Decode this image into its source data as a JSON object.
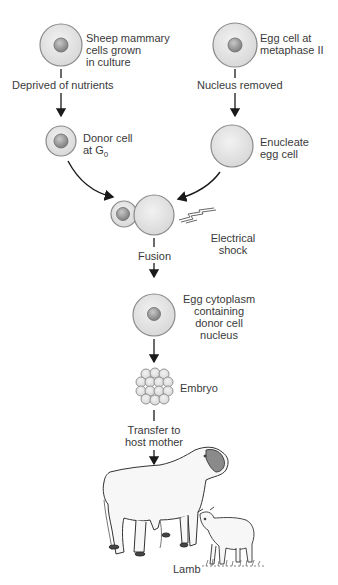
{
  "diagram": {
    "colors": {
      "cell_fill": "#e4e4e4",
      "cell_stroke": "#8a8a8a",
      "nucleus_fill": "#9a9a9a",
      "arrow": "#1a1a1a",
      "text": "#3a3a3a"
    },
    "nodes": {
      "mammary_cells": {
        "label": "Sheep mammary\ncells grown\nin culture"
      },
      "egg_cell": {
        "label": "Egg cell at\nmetaphase II"
      },
      "donor_cell": {
        "label_main": "Donor cell\nat G",
        "label_sub": "0"
      },
      "enucleate_egg": {
        "label": "Enucleate\negg cell"
      },
      "electrical_shock": {
        "label": "Electrical\nshock"
      },
      "fused_cell": {
        "label": "Egg cytoplasm\ncontaining\ndonor cell\nnucleus"
      },
      "embryo": {
        "label": "Embryo"
      },
      "lamb": {
        "label": "Lamb"
      }
    },
    "steps": {
      "deprived": "Deprived of nutrients",
      "nucleus_removed": "Nucleus removed",
      "fusion": "Fusion",
      "transfer": "Transfer to\nhost mother"
    }
  }
}
